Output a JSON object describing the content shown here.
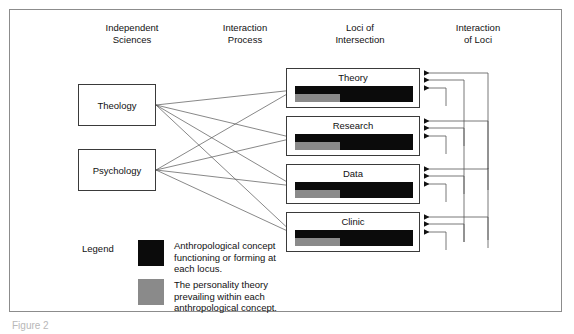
{
  "figure": {
    "caption_partial": "Figure 2"
  },
  "columns": [
    {
      "id": "independent-sciences",
      "label": "Independent\nSciences",
      "x": 72,
      "width": 120
    },
    {
      "id": "interaction-process",
      "label": "Interaction\nProcess",
      "x": 185,
      "width": 120
    },
    {
      "id": "loci-of-intersection",
      "label": "Loci of\nIntersection",
      "x": 300,
      "width": 120
    },
    {
      "id": "interaction-of-loci",
      "label": "Interaction\nof Loci",
      "x": 418,
      "width": 120
    }
  ],
  "sciences": [
    {
      "id": "theology",
      "label": "Theology",
      "x": 78,
      "y": 84,
      "w": 78,
      "h": 42
    },
    {
      "id": "psychology",
      "label": "Psychology",
      "x": 78,
      "y": 149,
      "w": 78,
      "h": 42
    }
  ],
  "loci": [
    {
      "id": "theory",
      "label": "Theory",
      "x": 286,
      "y": 68,
      "w": 134,
      "h": 40
    },
    {
      "id": "research",
      "label": "Research",
      "x": 286,
      "y": 116,
      "w": 134,
      "h": 40
    },
    {
      "id": "data",
      "label": "Data",
      "x": 286,
      "y": 164,
      "w": 134,
      "h": 40
    },
    {
      "id": "clinic",
      "label": "Clinic",
      "x": 286,
      "y": 212,
      "w": 134,
      "h": 40
    }
  ],
  "legend": {
    "title": "Legend",
    "items": [
      {
        "id": "anthropological-concept",
        "color": "#0b0b0b",
        "text": "Anthropological concept\nfunctioning or forming at\neach locus."
      },
      {
        "id": "personality-theory",
        "color": "#8a8a8a",
        "text": "The personality theory\nprevailing within each\nanthropological concept."
      }
    ]
  },
  "colors": {
    "concept_black": "#0b0b0b",
    "theory_gray": "#8a8a8a",
    "line": "#555555",
    "box_border": "#3a3a3a",
    "frame_border": "#8c8c8c",
    "background": "#ffffff"
  },
  "connections": {
    "description": "Each independent science connects to the concept bar of every locus.",
    "edges": [
      {
        "from": "theology",
        "to": "theory"
      },
      {
        "from": "theology",
        "to": "research"
      },
      {
        "from": "theology",
        "to": "data"
      },
      {
        "from": "theology",
        "to": "clinic"
      },
      {
        "from": "psychology",
        "to": "theory"
      },
      {
        "from": "psychology",
        "to": "research"
      },
      {
        "from": "psychology",
        "to": "data"
      },
      {
        "from": "psychology",
        "to": "clinic"
      }
    ],
    "loci_arrow_count_per_box": 3
  }
}
